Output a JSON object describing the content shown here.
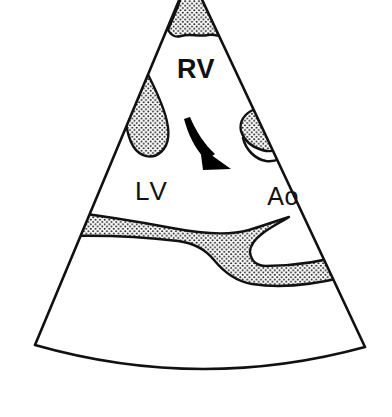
{
  "figure": {
    "name": "echocardiographic-sector-scan-diagram",
    "background_color": "#ffffff",
    "line_color": "#111111",
    "stipple_dot_color": "#1a1a1a",
    "arrow_color": "#000000",
    "width": 392,
    "height": 417
  },
  "labels": {
    "rv": "RV",
    "lv": "LV",
    "ao": "Ao"
  },
  "annotations": {
    "flow_arrow_name": "curved-flow-arrow"
  },
  "regions": {
    "apex_wedge": "apex-stippled-wedge",
    "left_blob": "left-stippled-teardrop",
    "right_blob": "right-stippled-leaf",
    "lower_band": "lower-stippled-band",
    "hook_tail": "right-blob-hook-tail"
  },
  "sector": {
    "outline_name": "sector-outline",
    "apex_x": 190,
    "apex_y": -26,
    "left_base_x": 35,
    "left_base_y": 345,
    "right_base_x": 365,
    "right_base_y": 347,
    "arc_bulge_y": 385
  }
}
